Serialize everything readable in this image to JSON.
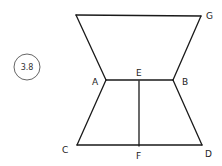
{
  "figure": {
    "badge": "3.8",
    "stroke_color": "#1a1a1a",
    "points": {
      "TL": {
        "x": 76,
        "y": 15
      },
      "G": {
        "x": 201,
        "y": 16
      },
      "A": {
        "x": 106,
        "y": 80
      },
      "B": {
        "x": 173,
        "y": 80
      },
      "E": {
        "x": 139,
        "y": 81
      },
      "C": {
        "x": 77,
        "y": 145
      },
      "F": {
        "x": 139,
        "y": 146
      },
      "D": {
        "x": 202,
        "y": 145
      }
    },
    "labels": {
      "G": "G",
      "A": "A",
      "E": "E",
      "B": "B",
      "C": "C",
      "F": "F",
      "D": "D"
    }
  }
}
